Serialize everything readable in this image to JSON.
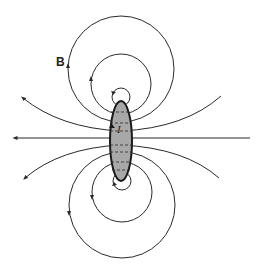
{
  "diagram": {
    "type": "magnetic field lines around a current-carrying conductor cross-section",
    "field_label": "B",
    "current_label": "I",
    "colors": {
      "line": "#2a2a2a",
      "conductor_fill": "#a8a8a8",
      "background": "#ffffff"
    },
    "elements": {
      "conductor": "shaded ellipse at center",
      "top_loops": 3,
      "bottom_loops": 3,
      "open_field_lines": 5,
      "horizontal_axis": "arrow pointing left"
    }
  }
}
